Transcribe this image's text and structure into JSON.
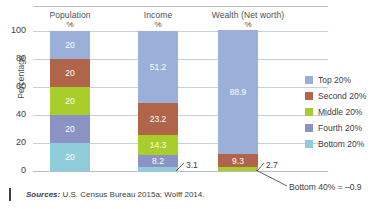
{
  "chart_data": {
    "type": "bar",
    "subtype": "stacked-bar-100",
    "title": "",
    "xlabel": "",
    "ylabel": "Percentage",
    "ylim": [
      0,
      100
    ],
    "yticks": [
      0,
      20,
      40,
      60,
      80,
      100
    ],
    "grid": true,
    "legend_position": "right",
    "categories": [
      "Population",
      "Income",
      "Wealth (Net worth)"
    ],
    "category_units": [
      "%",
      "%",
      "%"
    ],
    "series": [
      {
        "name": "Top 20%",
        "color": "#9ab0d8",
        "values": [
          20,
          51.2,
          88.9
        ]
      },
      {
        "name": "Second 20%",
        "color": "#b0654a",
        "values": [
          20,
          23.2,
          9.3
        ]
      },
      {
        "name": "Middle 20%",
        "color": "#a9ce2b",
        "values": [
          20,
          14.3,
          2.7
        ]
      },
      {
        "name": "Fourth 20%",
        "color": "#8b93c4",
        "values": [
          20,
          8.2,
          0
        ]
      },
      {
        "name": "Bottom 20%",
        "color": "#8ecdd9",
        "values": [
          20,
          3.1,
          0
        ]
      }
    ],
    "annotations": [
      {
        "text": "3.1",
        "series": "Bottom 20%",
        "category": "Income"
      },
      {
        "text": "2.7",
        "series": "Middle 20%",
        "category": "Wealth (Net worth)"
      },
      {
        "text": "Bottom 40% = –0.9",
        "category": "Wealth (Net worth)"
      }
    ]
  },
  "axis": {
    "y_title": "Percentage",
    "y_ticks": [
      "100",
      "80",
      "60",
      "40",
      "20",
      "0"
    ]
  },
  "headers": [
    {
      "name": "Population",
      "unit": "%"
    },
    {
      "name": "Income",
      "unit": "%"
    },
    {
      "name": "Wealth (Net worth)",
      "unit": "%"
    }
  ],
  "bars": {
    "population": {
      "segments": [
        {
          "label": "20",
          "value": 20,
          "color": "#9ab0d8"
        },
        {
          "label": "20",
          "value": 20,
          "color": "#b0654a"
        },
        {
          "label": "20",
          "value": 20,
          "color": "#a9ce2b"
        },
        {
          "label": "20",
          "value": 20,
          "color": "#8b93c4"
        },
        {
          "label": "20",
          "value": 20,
          "color": "#8ecdd9"
        }
      ]
    },
    "income": {
      "segments": [
        {
          "label": "51.2",
          "value": 51.2,
          "color": "#9ab0d8"
        },
        {
          "label": "23.2",
          "value": 23.2,
          "color": "#b0654a"
        },
        {
          "label": "14.3",
          "value": 14.3,
          "color": "#a9ce2b"
        },
        {
          "label": "8.2",
          "value": 8.2,
          "color": "#8b93c4"
        },
        {
          "label": "",
          "value": 3.1,
          "color": "#8ecdd9"
        }
      ]
    },
    "wealth": {
      "segments": [
        {
          "label": "88.9",
          "value": 88.9,
          "color": "#9ab0d8"
        },
        {
          "label": "9.3",
          "value": 9.3,
          "color": "#b0654a"
        },
        {
          "label": "",
          "value": 2.7,
          "color": "#a9ce2b"
        }
      ]
    }
  },
  "callouts": {
    "income_bottom": "3.1",
    "wealth_middle": "2.7",
    "bottom40": "Bottom 40% = –0.9"
  },
  "legend": {
    "items": [
      {
        "label": "Top 20%",
        "color": "#9ab0d8"
      },
      {
        "label": "Second 20%",
        "color": "#b0654a"
      },
      {
        "label": "Middle 20%",
        "color": "#a9ce2b"
      },
      {
        "label": "Fourth 20%",
        "color": "#8b93c4"
      },
      {
        "label": "Bottom 20%",
        "color": "#8ecdd9"
      }
    ]
  },
  "source": {
    "prefix": "Sources:",
    "text": " U.S. Census Bureau 2015a; Wolff 2014."
  }
}
